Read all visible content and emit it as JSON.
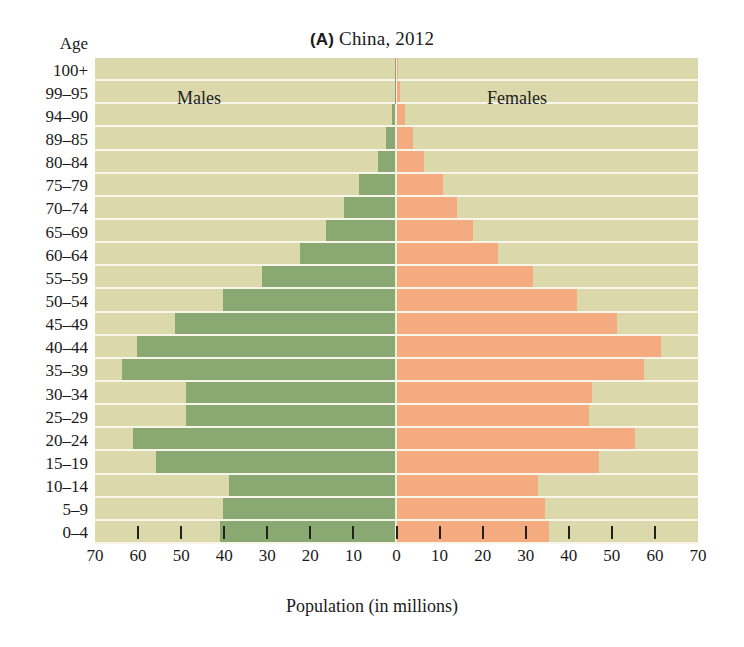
{
  "chart_data": {
    "type": "bar",
    "subtype": "population-pyramid",
    "panel_letter": "(A)",
    "title": "China, 2012",
    "title_full": "(A) China, 2012",
    "xlabel": "Population (in millions)",
    "ylabel": "Age",
    "xlim": [
      -70,
      70
    ],
    "x_ticks": [
      70,
      60,
      50,
      40,
      30,
      20,
      10,
      0,
      10,
      20,
      30,
      40,
      50,
      60,
      70
    ],
    "x_tick_labels": [
      "70",
      "60",
      "50",
      "40",
      "30",
      "20",
      "10",
      "0",
      "10",
      "20",
      "30",
      "40",
      "50",
      "60",
      "70"
    ],
    "grid": true,
    "legend_position": "inside-top",
    "categories": [
      "100+",
      "99–95",
      "94–90",
      "89–85",
      "80–84",
      "75–79",
      "70–74",
      "65–69",
      "60–64",
      "55–59",
      "50–54",
      "45–49",
      "40–44",
      "35–39",
      "30–34",
      "25–29",
      "20–24",
      "15–19",
      "10–14",
      "5–9",
      "0–4"
    ],
    "series": [
      {
        "name": "Males",
        "side": "left",
        "color": "#8aa871",
        "values": [
          0.1,
          0.4,
          1.1,
          2.4,
          4.3,
          8.6,
          12.2,
          16.3,
          22.3,
          31.3,
          40.2,
          51.4,
          60.3,
          63.8,
          48.9,
          48.9,
          61.2,
          55.8,
          38.9,
          40.2,
          41.0
        ]
      },
      {
        "name": "Females",
        "side": "right",
        "color": "#f3ab7f",
        "values": [
          0.2,
          0.9,
          2.0,
          3.8,
          6.3,
          10.8,
          14.0,
          17.7,
          23.5,
          31.7,
          41.8,
          51.2,
          61.5,
          57.5,
          45.5,
          44.6,
          55.4,
          46.9,
          32.8,
          34.5,
          35.3
        ]
      }
    ]
  },
  "figure": {
    "panel_letter": "(A)",
    "title_text": "China, 2012",
    "age_axis_label": "Age",
    "x_axis_title": "Population (in millions)",
    "males_label": "Males",
    "females_label": "Females",
    "plot_background": "#d9d7a6",
    "gridline_color": "#f7f6e8",
    "male_color": "#8aa871",
    "female_color": "#f3ab7f"
  }
}
